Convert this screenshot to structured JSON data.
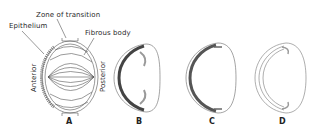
{
  "figure": {
    "labels": {
      "zone_of_transition": "Zone of transition",
      "epithelium": "Epithelium",
      "fibrous_body": "Fibrous body",
      "anterior": "Anterior",
      "posterior": "Posterior"
    },
    "panels": [
      {
        "id": "A",
        "label": "A"
      },
      {
        "id": "B",
        "label": "B"
      },
      {
        "id": "C",
        "label": "C"
      },
      {
        "id": "D",
        "label": "D"
      }
    ],
    "colors": {
      "line": "#555555",
      "shade": "#9a9a9a",
      "dots": "#c8c8c8"
    }
  }
}
